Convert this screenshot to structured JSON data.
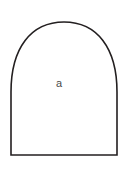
{
  "figure": {
    "kind": "geometry-diagram",
    "background_color": "#ffffff",
    "stroke_color": "#231f20",
    "stroke_width_px": 1.6,
    "shape": {
      "name": "arch",
      "description": "Closed arch / dome outline with flat horizontal base, straight near-vertical sides and a rounded flattened top",
      "fill_color": "#ffffff",
      "base_left_x": 11,
      "base_right_x": 117,
      "base_y": 155,
      "apex_y": 22,
      "apex_center_x": 64,
      "path": "M 11,155 L 11,92 C 11,48 31,22 64,22 C 97,22 117,48 117,92 L 117,155 Z"
    },
    "labels": [
      {
        "name": "interior-label",
        "text": "a",
        "color": "#4a4a4a",
        "font_size_px": 11,
        "x": 59,
        "y": 83
      }
    ]
  }
}
